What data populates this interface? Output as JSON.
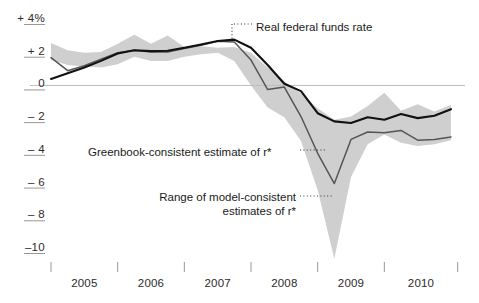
{
  "chart_data": {
    "type": "line",
    "title": "",
    "subtitle": "",
    "xlabel": "",
    "ylabel": "",
    "ylim": [
      -10.8,
      4.6
    ],
    "xlim": [
      2004.75,
      2010.85
    ],
    "grid": false,
    "zero_line": true,
    "legend_position": "inline-annotations",
    "y_unit": "percent",
    "y_ticks": [
      {
        "value": 4,
        "label": "+ 4%"
      },
      {
        "value": 2,
        "label": "+ 2"
      },
      {
        "value": 0,
        "label": "0"
      },
      {
        "value": -2,
        "label": "– 2"
      },
      {
        "value": -4,
        "label": "– 4"
      },
      {
        "value": -6,
        "label": "– 6"
      },
      {
        "value": -8,
        "label": "– 8"
      },
      {
        "value": -10,
        "label": "–10"
      }
    ],
    "x_tick_values": [
      2004.75,
      2005.75,
      2006.75,
      2007.75,
      2008.75,
      2009.75,
      2010.85
    ],
    "x_category_labels": [
      "2005",
      "2006",
      "2007",
      "2008",
      "2009",
      "2010"
    ],
    "x": [
      2004.75,
      2005.0,
      2005.25,
      2005.5,
      2005.75,
      2006.0,
      2006.25,
      2006.5,
      2006.75,
      2007.0,
      2007.25,
      2007.5,
      2007.75,
      2008.0,
      2008.25,
      2008.5,
      2008.75,
      2009.0,
      2009.25,
      2009.5,
      2009.75,
      2010.0,
      2010.25,
      2010.5,
      2010.75
    ],
    "series": [
      {
        "name": "Real federal funds rate",
        "color": "#111111",
        "width": 2.1,
        "values": [
          0.4,
          0.75,
          1.1,
          1.5,
          1.95,
          2.15,
          2.1,
          2.12,
          2.3,
          2.5,
          2.72,
          2.8,
          2.3,
          1.25,
          0.1,
          -0.35,
          -1.7,
          -2.2,
          -2.3,
          -1.95,
          -2.1,
          -1.75,
          -2.0,
          -1.85,
          -1.45
        ]
      },
      {
        "name": "Greenbook-consistent estimate of r*",
        "color": "#555555",
        "width": 1.5,
        "values": [
          1.7,
          0.9,
          1.2,
          1.6,
          2.0,
          2.15,
          2.05,
          2.05,
          2.25,
          2.45,
          2.7,
          2.65,
          1.55,
          -0.25,
          -0.1,
          -1.9,
          -4.15,
          -6.0,
          -3.3,
          -2.85,
          -2.9,
          -2.75,
          -3.35,
          -3.3,
          -3.15
        ]
      }
    ],
    "band": {
      "name": "Range of model-consistent estimates of r*",
      "color": "#cfcfcf",
      "upper": [
        2.6,
        2.15,
        2.0,
        2.05,
        2.55,
        3.1,
        2.55,
        3.05,
        2.35,
        2.4,
        2.3,
        2.35,
        2.0,
        1.1,
        0.25,
        -0.5,
        -1.4,
        -2.1,
        -1.9,
        -1.25,
        -0.45,
        -1.55,
        -1.15,
        -1.6,
        -1.2
      ],
      "lower": [
        1.55,
        1.25,
        1.15,
        1.1,
        1.3,
        1.75,
        1.5,
        1.5,
        1.75,
        1.9,
        2.0,
        1.5,
        0.0,
        -1.35,
        -1.95,
        -3.4,
        -6.4,
        -10.6,
        -5.6,
        -3.6,
        -3.0,
        -3.5,
        -3.7,
        -3.6,
        -3.35
      ]
    },
    "annotations": [
      {
        "id": "real-federal-funds-rate",
        "text": "Real federal funds rate",
        "leader": "dotted",
        "text_x": 256,
        "text_y": 20,
        "align": "left",
        "leader_from": [
          252,
          24
        ],
        "leader_to": [
          232,
          24
        ],
        "leader_drop_to": [
          232,
          40
        ]
      },
      {
        "id": "greenbook-consistent-estimate",
        "text": "Greenbook-consistent estimate of r*",
        "leader": "dotted",
        "text_x": 88,
        "text_y": 145,
        "align": "left",
        "leader_from": [
          300,
          150
        ],
        "leader_to": [
          326,
          150
        ]
      },
      {
        "id": "range-of-model-consistent-estimates",
        "text_line1": "Range of model-consistent",
        "text_line2": "estimates of r*",
        "leader": "dotted",
        "text_x": 131,
        "text_y": 190,
        "align": "right",
        "leader_from": [
          300,
          196
        ],
        "leader_to": [
          333,
          196
        ]
      }
    ]
  },
  "axes": {
    "zero_line_color": "#bdbdbd",
    "tick_color": "#8c8c8c",
    "label_color": "#2b2b2b"
  }
}
